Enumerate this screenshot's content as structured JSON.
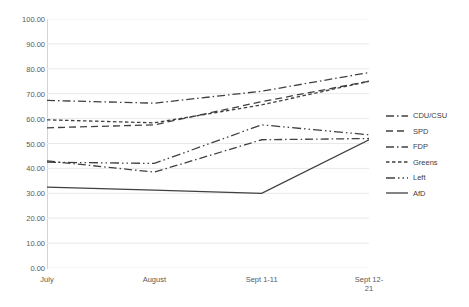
{
  "title": "",
  "chart_data": {
    "type": "line",
    "title": "",
    "xlabel": "",
    "ylabel": "",
    "ylim": [
      0,
      100
    ],
    "ytick_step": 10,
    "ytick_labels": [
      "100.00",
      "90.00",
      "80.00",
      "70.00",
      "60.00",
      "50.00",
      "40.00",
      "30.00",
      "20.00",
      "10.00",
      "0.00"
    ],
    "ytick_values": [
      100,
      90,
      80,
      70,
      60,
      50,
      40,
      30,
      20,
      10,
      0
    ],
    "grid": true,
    "legend_position": "right",
    "categories": [
      "July",
      "August",
      "Sept 1-11",
      "Sept 12-21"
    ],
    "category_labels": [
      "July",
      "August",
      "Sept 1-11",
      "Sept 12-\n21"
    ],
    "series": [
      {
        "name": "CDU/CSU",
        "dash": "dash-dot",
        "values": [
          67.3,
          66.2,
          71.0,
          78.5
        ]
      },
      {
        "name": "SPD",
        "dash": "dash",
        "values": [
          56.3,
          57.5,
          66.8,
          75.0
        ]
      },
      {
        "name": "FDP",
        "dash": "dash-dot",
        "values": [
          43.0,
          38.5,
          51.5,
          52.0
        ]
      },
      {
        "name": "Greens",
        "dash": "fine-dash",
        "values": [
          59.5,
          58.3,
          65.5,
          75.0
        ]
      },
      {
        "name": "Left",
        "dash": "dash-dot-dot",
        "values": [
          42.5,
          42.0,
          57.5,
          53.5
        ]
      },
      {
        "name": "AfD",
        "dash": "solid",
        "values": [
          32.5,
          31.3,
          30.0,
          51.5
        ]
      }
    ],
    "line_color": "#404040"
  }
}
